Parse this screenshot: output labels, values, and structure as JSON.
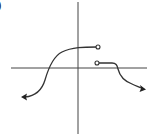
{
  "figure": {
    "corner_label": ")",
    "colors": {
      "background": "#ffffff",
      "stroke": "#333333",
      "axis": "#444444"
    }
  },
  "axes": {
    "x_axis": {
      "y": 68,
      "x_start": 11,
      "x_end": 147
    },
    "y_axis": {
      "x": 78,
      "y_start": 2,
      "y_end": 134
    }
  },
  "curves": [
    {
      "name": "left-piece",
      "path": "M 25 97 C 36 96, 42 90, 45 80 C 49 66, 54 56, 62 52 C 72 47, 84 47, 97 47",
      "start_marker": "arrow",
      "end_marker": "open-circle",
      "end_point": [
        98,
        47
      ]
    },
    {
      "name": "right-piece",
      "path": "M 99 63 L 112 63 C 116 63, 117 65, 118 69 C 120 77, 124 81, 132 84 C 136 86, 139 87, 141 88",
      "start_marker": "open-circle",
      "start_point": [
        97,
        63
      ],
      "end_marker": "arrow"
    }
  ],
  "markers": {
    "open_circle_radius": 2,
    "arrow_left": {
      "tip": [
        22,
        97
      ],
      "icon": "arrow-left-icon"
    },
    "arrow_right": {
      "tip": [
        145,
        89
      ],
      "icon": "arrow-right-icon"
    }
  }
}
